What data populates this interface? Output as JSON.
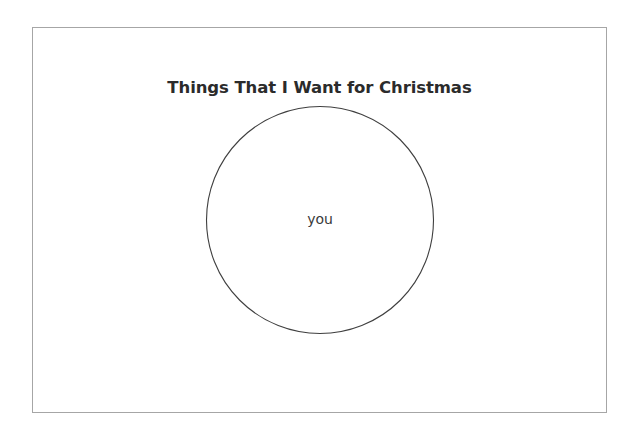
{
  "slide": {
    "title": "Things That I Want for Christmas",
    "background_color": "#ffffff",
    "frame_border_color": "#a6a6a6"
  },
  "diagram": {
    "type": "venn",
    "set_count": 1,
    "stroke_color": "#3f3f3f",
    "fill_color": "none",
    "sets": [
      {
        "label": "you",
        "label_color": "#3a3a3a"
      }
    ]
  }
}
